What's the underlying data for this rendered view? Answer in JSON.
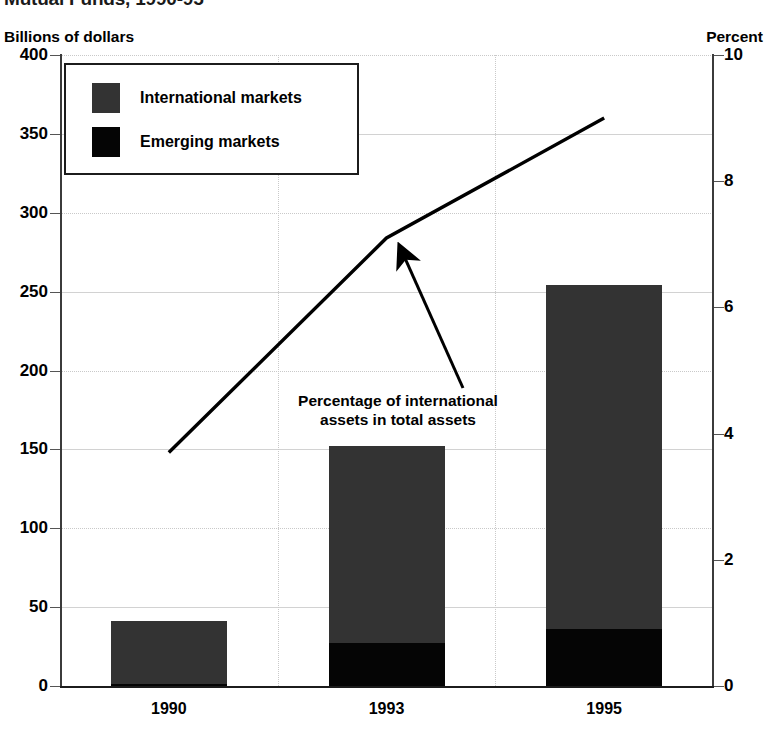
{
  "title": "Mutual Funds, 1990-95",
  "axis_left_caption": "Billions of dollars",
  "axis_right_caption": "Percent",
  "legend": {
    "items": [
      {
        "label": "International markets",
        "color": "#333333"
      },
      {
        "label": "Emerging markets",
        "color": "#050505"
      }
    ]
  },
  "annotation": {
    "line1": "Percentage of international",
    "line2": "assets in total assets"
  },
  "chart_data": {
    "type": "bar",
    "title": "Mutual Funds, 1990-95",
    "xlabel": "",
    "ylabel": "Billions of dollars",
    "y2label": "Percent",
    "categories": [
      "1990",
      "1993",
      "1995"
    ],
    "ylim": [
      0,
      400
    ],
    "yticks": [
      0,
      50,
      100,
      150,
      200,
      250,
      300,
      350,
      400
    ],
    "y2lim": [
      0,
      10
    ],
    "y2ticks": [
      0,
      2,
      4,
      6,
      8,
      10
    ],
    "grid": true,
    "legend_position": "upper-left",
    "stacked": true,
    "series": [
      {
        "name": "Emerging markets",
        "color": "#050505",
        "axis": "left",
        "values": [
          1,
          27,
          36
        ]
      },
      {
        "name": "International markets",
        "color": "#333333",
        "axis": "left",
        "values": [
          40,
          125,
          218
        ]
      }
    ],
    "totals": [
      41,
      152,
      254
    ],
    "overlay_line": {
      "name": "Percentage of international assets in total assets",
      "axis": "right",
      "color": "#000000",
      "x": [
        "1990",
        "1993",
        "1995"
      ],
      "values": [
        3.7,
        7.1,
        9.0
      ]
    }
  }
}
